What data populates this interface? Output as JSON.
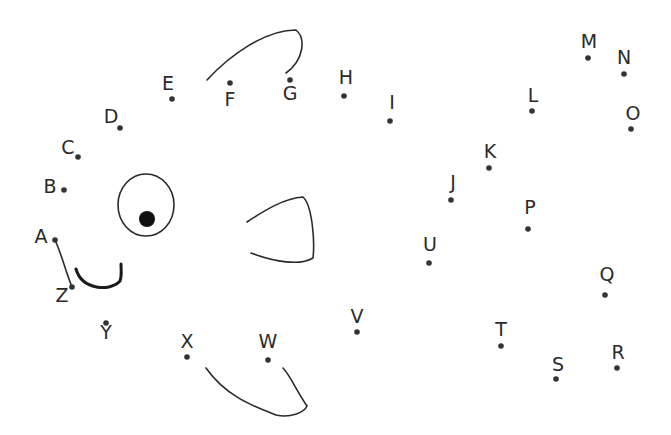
{
  "worksheet": {
    "type": "dot-to-dot fish",
    "colors": {
      "ink": "#2a2a2a",
      "dot": "#333333",
      "background": "#ffffff"
    },
    "points": [
      {
        "label": "A",
        "dot": [
          55,
          240
        ],
        "text": [
          41,
          237
        ]
      },
      {
        "label": "B",
        "dot": [
          64,
          190
        ],
        "text": [
          50,
          187
        ]
      },
      {
        "label": "C",
        "dot": [
          78,
          157
        ],
        "text": [
          68,
          148
        ]
      },
      {
        "label": "D",
        "dot": [
          120,
          128
        ],
        "text": [
          111,
          117
        ]
      },
      {
        "label": "E",
        "dot": [
          172,
          99
        ],
        "text": [
          168,
          84
        ]
      },
      {
        "label": "F",
        "dot": [
          230,
          83
        ],
        "text": [
          230,
          100
        ]
      },
      {
        "label": "G",
        "dot": [
          290,
          80
        ],
        "text": [
          290,
          94
        ]
      },
      {
        "label": "H",
        "dot": [
          344,
          96
        ],
        "text": [
          346,
          78
        ]
      },
      {
        "label": "I",
        "dot": [
          390,
          121
        ],
        "text": [
          392,
          103
        ]
      },
      {
        "label": "J",
        "dot": [
          451,
          200
        ],
        "text": [
          453,
          183
        ]
      },
      {
        "label": "K",
        "dot": [
          489,
          168
        ],
        "text": [
          490,
          152
        ]
      },
      {
        "label": "L",
        "dot": [
          532,
          111
        ],
        "text": [
          533,
          96
        ]
      },
      {
        "label": "M",
        "dot": [
          588,
          58
        ],
        "text": [
          589,
          42
        ]
      },
      {
        "label": "N",
        "dot": [
          624,
          74
        ],
        "text": [
          624,
          58
        ]
      },
      {
        "label": "O",
        "dot": [
          631,
          129
        ],
        "text": [
          633,
          114
        ]
      },
      {
        "label": "P",
        "dot": [
          528,
          229
        ],
        "text": [
          530,
          208
        ]
      },
      {
        "label": "Q",
        "dot": [
          605,
          295
        ],
        "text": [
          607,
          275
        ]
      },
      {
        "label": "R",
        "dot": [
          617,
          368
        ],
        "text": [
          618,
          353
        ]
      },
      {
        "label": "S",
        "dot": [
          556,
          379
        ],
        "text": [
          558,
          365
        ]
      },
      {
        "label": "T",
        "dot": [
          501,
          346
        ],
        "text": [
          501,
          330
        ]
      },
      {
        "label": "U",
        "dot": [
          429,
          263
        ],
        "text": [
          430,
          245
        ]
      },
      {
        "label": "V",
        "dot": [
          357,
          332
        ],
        "text": [
          357,
          317
        ]
      },
      {
        "label": "W",
        "dot": [
          268,
          360
        ],
        "text": [
          268,
          342
        ]
      },
      {
        "label": "X",
        "dot": [
          187,
          357
        ],
        "text": [
          187,
          342
        ]
      },
      {
        "label": "Y",
        "dot": [
          106,
          323
        ],
        "text": [
          106,
          333
        ]
      },
      {
        "label": "Z",
        "dot": [
          72,
          287
        ],
        "text": [
          62,
          296
        ]
      }
    ],
    "drawn_shapes": {
      "top_fin": "M 207 80 C 230 55, 265 30, 296 30 C 306 38, 304 60, 286 73",
      "bottom_fin": "M 206 368 C 225 395, 250 405, 276 415 C 290 418, 304 413, 307 406 C 296 390, 290 375, 283 368",
      "side_fin": "M 247 222 C 265 210, 285 198, 303 197 C 312 205, 315 240, 313 258 C 300 266, 275 262, 251 253",
      "eye_outline": {
        "cx": 146,
        "cy": 205,
        "rx": 28,
        "ry": 31
      },
      "pupil": {
        "cx": 147,
        "cy": 219,
        "r": 8
      },
      "mouth": "M 76 269 C 82 290, 110 292, 120 281 C 122 276, 121 270, 121 264",
      "connector_A_Z": "M 55 240 C 62 255, 65 270, 72 287"
    }
  }
}
